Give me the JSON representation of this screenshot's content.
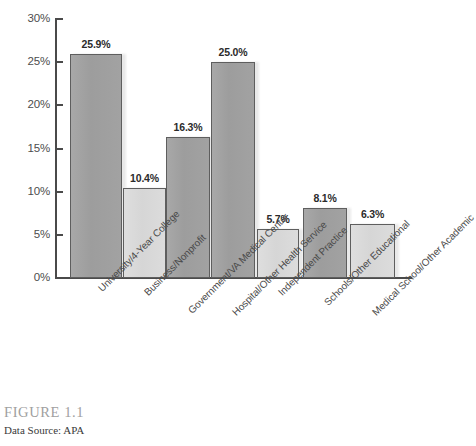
{
  "chart_data": {
    "type": "bar",
    "title": "",
    "xlabel": "",
    "ylabel": "",
    "ylim": [
      0,
      30
    ],
    "grid": false,
    "legend": "none",
    "ytick_labels": [
      "30%",
      "25%",
      "20%",
      "15%",
      "10%",
      "5%",
      "0%"
    ],
    "ytick_values": [
      30,
      25,
      20,
      15,
      10,
      5,
      0
    ],
    "categories": [
      "University/4-Year College",
      "Business/Nonprofit",
      "Government/VA Medical Center",
      "Hospital/Other Health Service",
      "Independent Practice",
      "Schools/Other Educational",
      "Medical School/Other Academic"
    ],
    "values": [
      25.9,
      10.4,
      16.3,
      25.0,
      5.7,
      8.1,
      6.3
    ],
    "value_labels": [
      "25.9%",
      "10.4%",
      "16.3%",
      "25.0%",
      "5.7%",
      "8.1%",
      "6.3%"
    ],
    "bar_shades": [
      "dark",
      "light",
      "dark",
      "dark",
      "light",
      "dark",
      "light"
    ],
    "colors": {
      "bar_dark": "#a0a0a0",
      "bar_light": "#dadada",
      "bar_outline": "#5e5e5e",
      "axis": "#4a4a4a",
      "value_text": "#2b2b2b",
      "tick_text": "#4d4d4d",
      "category_text": "#4a4a4a"
    }
  },
  "caption": {
    "figure_number": "FIGURE 1.1",
    "data_source": "Data Source: APA"
  }
}
